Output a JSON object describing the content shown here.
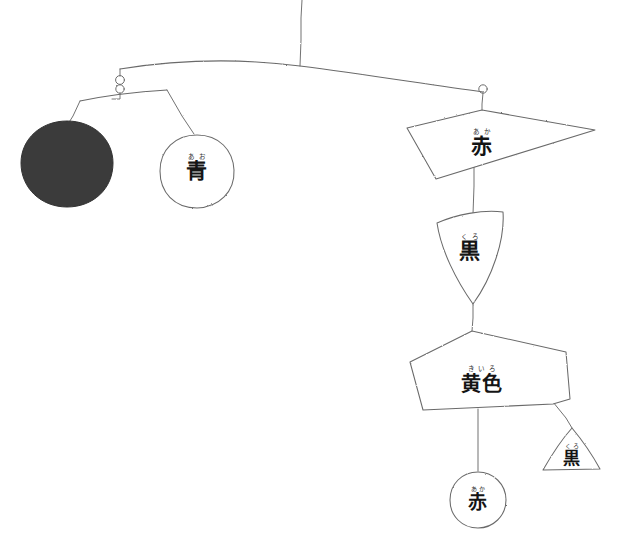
{
  "artwork": {
    "title": "Hanging paper mobile with Japanese colour words",
    "medium": "pencil drawing on white paper",
    "background_color": "#ffffff",
    "ink_color": "#6a6a6a",
    "text_color": "#141414",
    "solid_disc_color": "#3a3a3a"
  },
  "pieces": [
    {
      "id": "dark-disc",
      "shape": "filled-circle",
      "kanji": "",
      "furigana": "",
      "fill": "#3a3a3a",
      "cx": 67,
      "cy": 164,
      "r": 46
    },
    {
      "id": "ao-circle",
      "shape": "circle",
      "kanji": "青",
      "furigana": "あお",
      "reading": "ao",
      "meaning": "blue",
      "cx": 197,
      "cy": 171,
      "r": 37
    },
    {
      "id": "aka-quad",
      "shape": "quadrilateral",
      "kanji": "赤",
      "furigana": "あか",
      "reading": "aka",
      "meaning": "red",
      "cx": 482,
      "cy": 144
    },
    {
      "id": "kuro-fan",
      "shape": "triangle-fan",
      "kanji": "黒",
      "furigana": "くろ",
      "reading": "kuro",
      "meaning": "black",
      "cx": 470,
      "cy": 248
    },
    {
      "id": "kiiro-pentagon",
      "shape": "pentagon",
      "kanji": "黄色",
      "furigana": "きいろ",
      "reading": "kiiro",
      "meaning": "yellow",
      "cx": 482,
      "cy": 380
    },
    {
      "id": "kuro-small-triangle",
      "shape": "triangle",
      "kanji": "黒",
      "furigana": "くろ",
      "reading": "kuro",
      "meaning": "black",
      "cx": 572,
      "cy": 455
    },
    {
      "id": "aka-circle-bottom",
      "shape": "circle",
      "kanji": "赤",
      "furigana": "あか",
      "reading": "aka",
      "meaning": "red",
      "cx": 478,
      "cy": 500,
      "r": 28
    }
  ],
  "hardware": {
    "top_suspension_label": "suspension-string",
    "left_pivot_label": "pivot-ring-left",
    "right_pivot_label": "pivot-ring-right"
  }
}
